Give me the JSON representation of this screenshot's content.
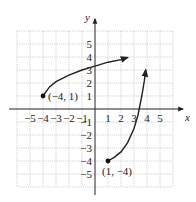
{
  "chart_data": {
    "type": "line",
    "title": "",
    "xlabel": "x",
    "ylabel": "y",
    "xlim": [
      -6,
      6
    ],
    "ylim": [
      -6,
      6
    ],
    "grid": true,
    "x_ticks": [
      -5,
      -4,
      -3,
      -2,
      -1,
      1,
      2,
      3,
      4,
      5
    ],
    "x_tick_labels": [
      "−5",
      "−4",
      "−3",
      "−2",
      "−1",
      "1",
      "2",
      "3",
      "4",
      "5"
    ],
    "y_ticks": [
      5,
      4,
      3,
      2,
      1,
      -1,
      -2,
      -3,
      -4,
      -5
    ],
    "y_tick_labels": [
      "5",
      "4",
      "3",
      "2",
      "1",
      "−1",
      "−2",
      "−3",
      "−4",
      "−5"
    ],
    "series": [
      {
        "name": "upper-curve",
        "start_point": {
          "x": -4,
          "y": 1,
          "label": "(−4, 1)"
        },
        "end_arrow": true,
        "points": [
          [
            -4,
            1
          ],
          [
            -3.5,
            1.7
          ],
          [
            -3,
            2.1
          ],
          [
            -2,
            2.6
          ],
          [
            -1,
            3.0
          ],
          [
            0,
            3.3
          ],
          [
            1,
            3.6
          ],
          [
            2,
            3.8
          ],
          [
            2.5,
            3.95
          ]
        ]
      },
      {
        "name": "lower-curve",
        "start_point": {
          "x": 1,
          "y": -4,
          "label": "(1, −4)"
        },
        "end_arrow": true,
        "points": [
          [
            1,
            -4
          ],
          [
            1.5,
            -3.7
          ],
          [
            2,
            -3.3
          ],
          [
            2.5,
            -2.6
          ],
          [
            3,
            -1.5
          ],
          [
            3.3,
            -0.5
          ],
          [
            3.6,
            1.0
          ],
          [
            3.8,
            2.2
          ],
          [
            3.9,
            3.0
          ]
        ]
      }
    ]
  }
}
